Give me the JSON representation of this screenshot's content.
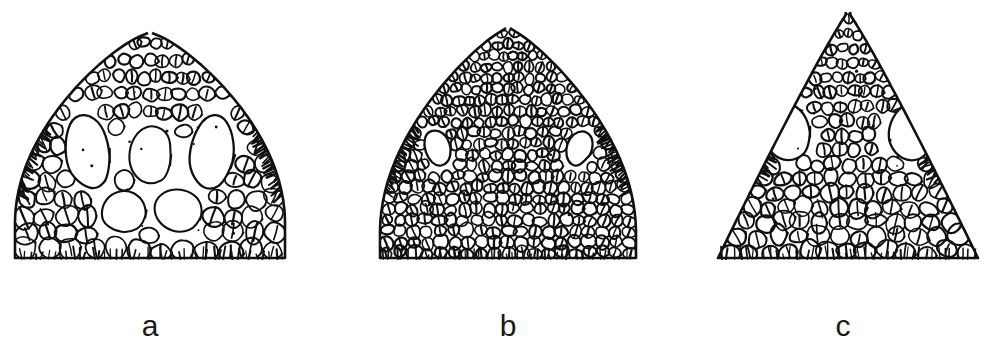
{
  "figure": {
    "type": "scientific-illustration-plate",
    "background_color": "#ffffff",
    "ink_color": "#101010",
    "width": 998,
    "height": 364,
    "panel_count": 3
  },
  "panels": [
    {
      "id": "a",
      "label": "a",
      "label_x": 150,
      "label_y": 335,
      "origin_x": 0,
      "box_width": 333,
      "snout_shape": "broadly rounded",
      "apex_x": 150,
      "apex_y": 33,
      "base_y": 258,
      "base_left_x": 16,
      "base_right_x": 286,
      "head_half_width": 135,
      "scale_texture": "large irregular plate-like head shields, strongly enlarged centrally",
      "scale_size": 17,
      "scale_rows": 13,
      "orbits": [
        {
          "side": "left",
          "cx": 88,
          "cy": 152,
          "rx": 23,
          "ry": 40,
          "rot": -8
        },
        {
          "side": "right",
          "cx": 212,
          "cy": 152,
          "rx": 23,
          "ry": 40,
          "rot": 8
        }
      ],
      "large_median_shields": [
        {
          "cx": 150,
          "cy": 155,
          "rx": 23,
          "ry": 31,
          "rot": 0
        },
        {
          "cx": 124,
          "cy": 212,
          "rx": 24,
          "ry": 22,
          "rot": -4
        },
        {
          "cx": 178,
          "cy": 210,
          "rx": 26,
          "ry": 23,
          "rot": 5
        }
      ],
      "stipple_count": 14,
      "fringe_ticks": 44
    },
    {
      "id": "b",
      "label": "b",
      "label_x": 508,
      "label_y": 335,
      "origin_x": 333,
      "box_width": 333,
      "snout_shape": "bluntly rounded, dome-like",
      "apex_x": 175,
      "apex_y": 28,
      "base_y": 258,
      "base_left_x": 55,
      "base_right_x": 310,
      "head_half_width": 128,
      "scale_texture": "uniform small granular scales, no enlarged shields",
      "scale_size": 11,
      "scale_rows": 21,
      "orbits": [
        {
          "side": "left",
          "cx": 105,
          "cy": 148,
          "rx": 13,
          "ry": 19,
          "rot": -18
        },
        {
          "side": "right",
          "cx": 246,
          "cy": 148,
          "rx": 13,
          "ry": 19,
          "rot": 18
        }
      ],
      "large_median_shields": [],
      "stipple_count": 4,
      "fringe_ticks": 40
    },
    {
      "id": "c",
      "label": "c",
      "label_x": 843,
      "label_y": 335,
      "origin_x": 666,
      "box_width": 332,
      "snout_shape": "narrow, acutely pointed",
      "apex_x": 182,
      "apex_y": 12,
      "base_y": 258,
      "base_left_x": 52,
      "base_right_x": 312,
      "head_half_width": 130,
      "scale_texture": "medium keeled scales, enlarged posteriorly, small anteriorly",
      "scale_size": 14,
      "scale_rows": 17,
      "orbits": [
        {
          "side": "left",
          "cx": 120,
          "cy": 132,
          "rx": 25,
          "ry": 30,
          "rot": -12
        },
        {
          "side": "right",
          "cx": 246,
          "cy": 132,
          "rx": 25,
          "ry": 30,
          "rot": 12
        }
      ],
      "large_median_shields": [],
      "stipple_count": 10,
      "fringe_ticks": 42
    }
  ]
}
